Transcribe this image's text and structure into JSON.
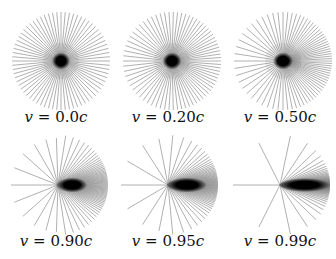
{
  "figure": {
    "line_count": 72,
    "line_color": "#6e6e6e",
    "core_color": "#000000",
    "panels": [
      {
        "id": "p1",
        "beta": 0.0,
        "label_var": "v",
        "label_eq": " = ",
        "label_val": "0.0",
        "label_unit": "c",
        "cx": 61,
        "cy": 61,
        "r": 49,
        "left": 0,
        "top": 0,
        "caption_top": 108
      },
      {
        "id": "p2",
        "beta": 0.2,
        "label_var": "v",
        "label_eq": " = ",
        "label_val": "0.20",
        "label_unit": "c",
        "cx": 172,
        "cy": 61,
        "r": 49,
        "left": 112,
        "top": 0,
        "caption_top": 108
      },
      {
        "id": "p3",
        "beta": 0.5,
        "label_var": "v",
        "label_eq": " = ",
        "label_val": "0.50",
        "label_unit": "c",
        "cx": 283,
        "cy": 61,
        "r": 49,
        "left": 224,
        "top": 0,
        "caption_top": 108
      },
      {
        "id": "p4",
        "beta": 0.9,
        "label_var": "v",
        "label_eq": " = ",
        "label_val": "0.90",
        "label_unit": "c",
        "cx": 58,
        "cy": 185,
        "r": 50,
        "left": 0,
        "top": 0,
        "caption_top": 232
      },
      {
        "id": "p5",
        "beta": 0.95,
        "label_var": "v",
        "label_eq": " = ",
        "label_val": "0.95",
        "label_unit": "c",
        "cx": 168,
        "cy": 185,
        "r": 50,
        "left": 112,
        "top": 0,
        "caption_top": 232
      },
      {
        "id": "p6",
        "beta": 0.99,
        "label_var": "v",
        "label_eq": " = ",
        "label_val": "0.99",
        "label_unit": "c",
        "cx": 280,
        "cy": 185,
        "r": 50,
        "left": 224,
        "top": 0,
        "caption_top": 232
      }
    ]
  },
  "labels": {
    "p1": "v = 0.0c",
    "p2": "v = 0.20c",
    "p3": "v = 0.50c",
    "p4": "v = 0.90c",
    "p5": "v = 0.95c",
    "p6": "v = 0.99c"
  }
}
